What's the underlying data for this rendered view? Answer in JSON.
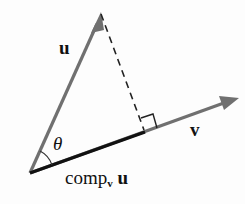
{
  "diagram": {
    "colors": {
      "vector_gray": "#707070",
      "projection_black": "#111111",
      "dashed": "#222222",
      "background": "#fdfdfd"
    },
    "labels": {
      "u": "u",
      "v": "v",
      "theta": "θ",
      "comp_main": "comp",
      "comp_sub": "v",
      "comp_tail": " u"
    },
    "nodes": [
      {
        "id": "origin",
        "x": 30,
        "y": 173
      },
      {
        "id": "u_tip",
        "x": 101,
        "y": 13
      },
      {
        "id": "v_tip",
        "x": 238,
        "y": 98
      },
      {
        "id": "foot",
        "x": 145,
        "y": 132
      }
    ],
    "edges": [
      {
        "from": "origin",
        "to": "u_tip",
        "type": "arrow",
        "label": "u"
      },
      {
        "from": "origin",
        "to": "v_tip",
        "type": "arrow",
        "label": "v"
      },
      {
        "from": "origin",
        "to": "foot",
        "type": "segment-bold",
        "label": "comp_v u"
      },
      {
        "from": "u_tip",
        "to": "foot",
        "type": "dashed"
      }
    ],
    "annotations": [
      "right-angle marker at foot",
      "angle arc θ at origin"
    ]
  }
}
